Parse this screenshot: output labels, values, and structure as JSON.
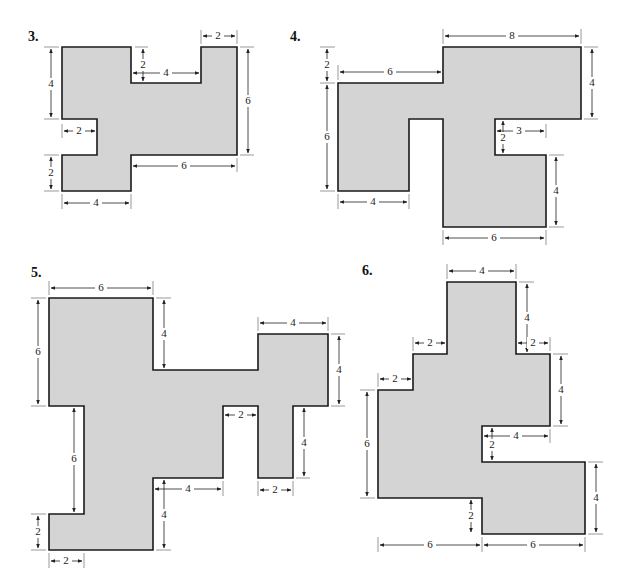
{
  "problems": [
    {
      "number": "3.",
      "labels": {
        "top_right_width": "2",
        "notch_depth": "2",
        "notch_width": "4",
        "right_height": "6",
        "left_upper_height": "4",
        "left_notch_width": "2",
        "left_lower_height": "2",
        "lower_right_width": "6",
        "bottom_width": "4"
      }
    },
    {
      "number": "4.",
      "labels": {
        "top_width": "8",
        "step_height": "2",
        "left_top_width": "6",
        "right_upper_height": "4",
        "left_height": "6",
        "notch_width": "3",
        "notch_height": "2",
        "right_lower_height": "4",
        "bottom_left_width": "4",
        "bottom_right_width": "6"
      }
    },
    {
      "number": "5.",
      "labels": {
        "top_width": "6",
        "left_upper_height": "6",
        "top_notch_depth": "4",
        "right_top_width": "4",
        "right_block_height": "4",
        "gap_width": "2",
        "left_mid_height": "6",
        "right_leg_height": "4",
        "mid_bottom_width": "4",
        "right_leg_width": "2",
        "lower_height": "4",
        "foot_height": "2",
        "foot_width": "2"
      }
    },
    {
      "number": "6.",
      "labels": {
        "top_width": "4",
        "top_height": "4",
        "step1_width": "2",
        "right_step_width": "2",
        "step2_width": "2",
        "right_mid_height": "4",
        "left_height": "6",
        "notch_width": "4",
        "notch_height": "2",
        "right_lower_height": "4",
        "bottom_step_height": "2",
        "bottom_left_width": "6",
        "bottom_right_width": "6"
      }
    }
  ]
}
